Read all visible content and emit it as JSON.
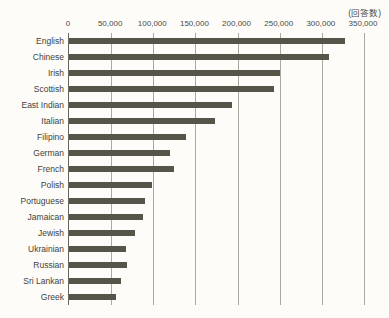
{
  "chart_data": {
    "type": "bar",
    "orientation": "horizontal",
    "title": "",
    "subtitle": "",
    "xlabel": "",
    "ylabel": "",
    "unit_caption": "(回答数)",
    "xlim": [
      0,
      350000
    ],
    "xticks": [
      0,
      50000,
      100000,
      150000,
      200000,
      250000,
      300000,
      350000
    ],
    "xtick_labels": [
      "0",
      "50,000",
      "100,000",
      "150,000",
      "200,000",
      "250,000",
      "300,000",
      "350,000"
    ],
    "grid": true,
    "grid_axis": "x",
    "legend": false,
    "legend_position": "none",
    "bar_color": "#57554a",
    "background_color": "#fdfcf9",
    "categories": [
      "English",
      "Chinese",
      "Irish",
      "Scottish",
      "East Indian",
      "Italian",
      "Filipino",
      "German",
      "French",
      "Polish",
      "Portuguese",
      "Jamaican",
      "Jewish",
      "Ukrainian",
      "Russian",
      "Sri Lankan",
      "Greek"
    ],
    "values": [
      327000,
      308000,
      250000,
      243000,
      193000,
      173000,
      139000,
      120000,
      124000,
      98000,
      90000,
      88000,
      78000,
      68000,
      69000,
      62000,
      56000
    ]
  }
}
